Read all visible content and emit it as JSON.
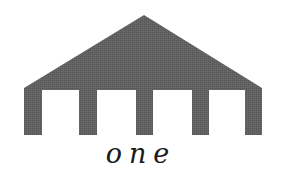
{
  "logo": {
    "icon": "pavilion-roof-with-columns-icon",
    "fill_color": "#5e5e5e",
    "background_color": "#ffffff",
    "wordmark": "one"
  }
}
